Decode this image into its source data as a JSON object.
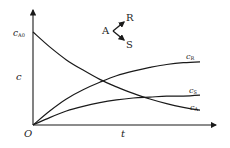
{
  "chart_data": {
    "type": "line",
    "title": "",
    "xlabel": "t",
    "ylabel": "c",
    "origin_label": "O",
    "y_start_label": {
      "main": "c",
      "sub": "A0"
    },
    "annotation": {
      "reactant": "A",
      "product_1": "R",
      "product_2": "S",
      "description": "Parallel reactions A → R, A → S"
    },
    "grid": false,
    "x": [
      0,
      0.1,
      0.2,
      0.3,
      0.4,
      0.5,
      0.6,
      0.7,
      0.8,
      0.9,
      1.0
    ],
    "series": [
      {
        "name": "c_A",
        "label_main": "c",
        "label_sub": "A",
        "values": [
          1.0,
          0.84,
          0.7,
          0.59,
          0.49,
          0.41,
          0.34,
          0.28,
          0.23,
          0.19,
          0.16
        ]
      },
      {
        "name": "c_R",
        "label_main": "c",
        "label_sub": "R",
        "values": [
          0.0,
          0.15,
          0.28,
          0.38,
          0.46,
          0.53,
          0.58,
          0.62,
          0.65,
          0.67,
          0.68
        ]
      },
      {
        "name": "c_S",
        "label_main": "c",
        "label_sub": "S",
        "values": [
          0.0,
          0.08,
          0.15,
          0.2,
          0.24,
          0.27,
          0.29,
          0.3,
          0.31,
          0.31,
          0.32
        ]
      }
    ],
    "xlim": [
      0,
      1.1
    ],
    "ylim": [
      0,
      1.2
    ],
    "legend": "inline labels at curve ends"
  },
  "colors": {
    "line": "#1a1a1a",
    "text": "#222222"
  }
}
